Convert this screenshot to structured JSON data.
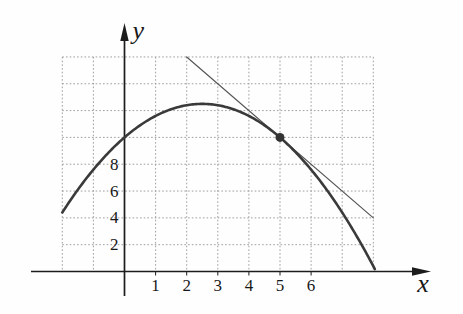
{
  "figure": {
    "kind": "textbook-graph-scan",
    "background": "#fefefe",
    "colors": {
      "axis": "#1c1c1c",
      "grid": "#949494",
      "curve": "#3a3a3a",
      "tangent": "#565656",
      "point": "#333333",
      "text": "#181818"
    }
  },
  "chart_data": {
    "type": "line",
    "title": "",
    "xlabel": "x",
    "ylabel": "y",
    "axes": {
      "x_label": "x",
      "y_label": "y",
      "x_tick_labels": [
        1,
        2,
        3,
        4,
        5,
        6
      ],
      "y_tick_labels": [
        2,
        4,
        6,
        8
      ],
      "x_range_shown": [
        -2,
        8
      ],
      "y_range_shown": [
        0,
        16
      ],
      "grid": true,
      "grid_x_step": 1,
      "grid_y_step": 2,
      "legend": "none"
    },
    "series": [
      {
        "name": "function-curve",
        "type": "quadratic",
        "coefficients": {
          "a": -0.4,
          "b": 2,
          "c": 10
        },
        "x_domain": [
          -2,
          8.09
        ],
        "points": [
          [
            -2,
            4.4
          ],
          [
            -1,
            7.6
          ],
          [
            0,
            10
          ],
          [
            1,
            11.6
          ],
          [
            2,
            12.4
          ],
          [
            2.5,
            12.5
          ],
          [
            3,
            12.4
          ],
          [
            4,
            11.6
          ],
          [
            5,
            10
          ],
          [
            6,
            7.6
          ],
          [
            7,
            4.4
          ],
          [
            8,
            0.4
          ]
        ]
      },
      {
        "name": "tangent-line",
        "type": "segment",
        "endpoints": [
          [
            2,
            16
          ],
          [
            8,
            4
          ]
        ],
        "slope": -2
      }
    ],
    "marked_point": {
      "x": 5,
      "y": 10
    }
  }
}
